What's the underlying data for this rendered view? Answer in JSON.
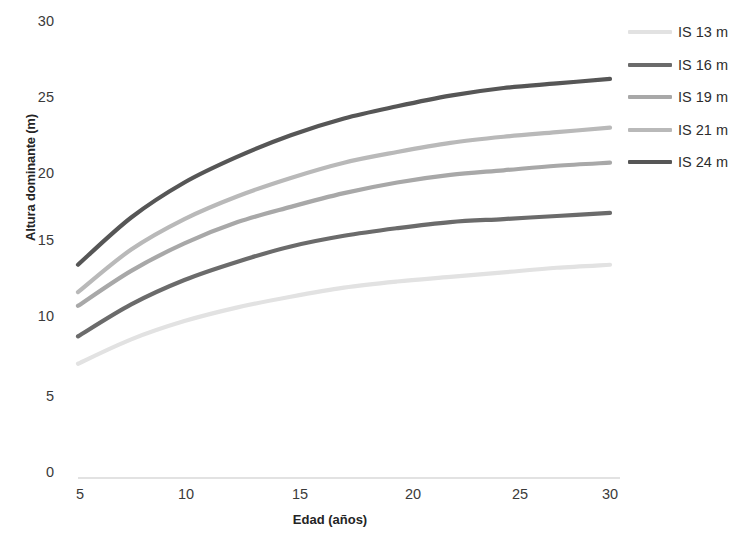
{
  "chart_data": {
    "type": "line",
    "title": "",
    "xlabel": "Edad (años)",
    "ylabel": "Altura dominante (m)",
    "xlim": [
      5,
      30
    ],
    "ylim": [
      0,
      30
    ],
    "xticks": [
      5,
      10,
      15,
      20,
      25,
      30
    ],
    "yticks": [
      0,
      5,
      10,
      15,
      20,
      25,
      30
    ],
    "grid": false,
    "legend_position": "right",
    "x": [
      5,
      7.5,
      10,
      12.5,
      15,
      17.5,
      20,
      22.5,
      25,
      27.5,
      30
    ],
    "series": [
      {
        "name": "IS 13 m",
        "color": "#e2e2e2",
        "values": [
          7.5,
          9.1,
          10.3,
          11.2,
          11.9,
          12.5,
          12.9,
          13.2,
          13.5,
          13.8,
          14.0
        ]
      },
      {
        "name": "IS 16 m",
        "color": "#6b6b6b",
        "values": [
          9.3,
          11.4,
          13.0,
          14.2,
          15.2,
          15.9,
          16.4,
          16.8,
          17.0,
          17.2,
          17.4
        ]
      },
      {
        "name": "IS 19 m",
        "color": "#a8a8a8",
        "values": [
          11.3,
          13.6,
          15.4,
          16.8,
          17.8,
          18.7,
          19.4,
          19.9,
          20.2,
          20.5,
          20.7
        ]
      },
      {
        "name": "IS 21 m",
        "color": "#b9b9b9",
        "values": [
          12.2,
          15.0,
          17.0,
          18.5,
          19.7,
          20.7,
          21.4,
          22.0,
          22.4,
          22.7,
          23.0
        ]
      },
      {
        "name": "IS 24 m",
        "color": "#565656",
        "values": [
          14.0,
          17.1,
          19.4,
          21.1,
          22.5,
          23.6,
          24.4,
          25.1,
          25.6,
          25.9,
          26.2
        ]
      }
    ],
    "baseline_color": "#d9d9d9"
  },
  "axis": {
    "y_title": "Altura dominante (m)",
    "x_title": "Edad (años)",
    "y_ticks": [
      "30",
      "25",
      "20",
      "15",
      "10",
      "5",
      "0"
    ],
    "x_ticks": [
      "5",
      "10",
      "15",
      "20",
      "25",
      "30"
    ]
  },
  "legend": {
    "items": [
      {
        "label": "IS 13 m"
      },
      {
        "label": "IS 16 m"
      },
      {
        "label": "IS 19 m"
      },
      {
        "label": "IS 21 m"
      },
      {
        "label": "IS 24 m"
      }
    ]
  }
}
